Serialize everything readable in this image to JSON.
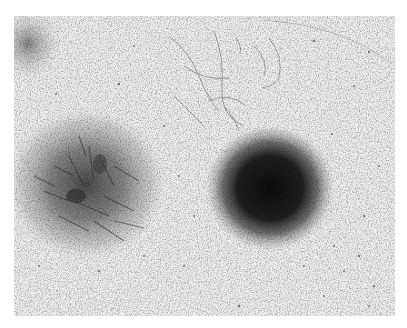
{
  "image": {
    "kind": "grayscale micrograph",
    "description": "Two cell colonies on a culture plate: a loose fibroblast-like radiating colony on the left and a dense, dark round colony on the right, with scattered cells and fibrous strands across a pale background.",
    "background_color": "#ececec",
    "frame": {
      "x": 14,
      "y": 16,
      "width": 381,
      "height": 300
    },
    "features": [
      {
        "name": "left-colony",
        "type": "loose radiating spindle-cell colony",
        "center": [
          84,
          184
        ],
        "radius": 75,
        "tone": "#3a3a3a"
      },
      {
        "name": "right-colony",
        "type": "dense compact round colony",
        "center": [
          268,
          188
        ],
        "radius": 62,
        "tone": "#141414"
      },
      {
        "name": "top-left-cluster",
        "type": "partial colony at corner",
        "center": [
          26,
          36
        ],
        "radius": 28,
        "tone": "#5a5a5a"
      },
      {
        "name": "top-center-strands",
        "type": "scattered fibrous cells",
        "center": [
          215,
          60
        ],
        "radius": 60,
        "tone": "#8a8a8a"
      },
      {
        "name": "plate-edge-arc",
        "type": "faint curved dish edge",
        "position": "top-right",
        "tone": "#c8c8c8"
      }
    ]
  }
}
